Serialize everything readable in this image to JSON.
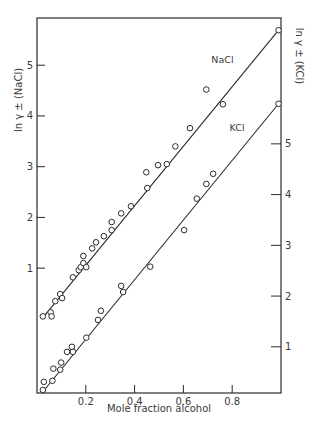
{
  "chart_data": {
    "type": "scatter",
    "title": "",
    "xlabel": "Mole fraction alcohol",
    "ylabel_left": "ln γ ± (NaCl)",
    "ylabel_right": "ln γ ± (KCl)",
    "xlim": [
      0,
      1.0
    ],
    "ylim_left": [
      -1.46,
      5.93
    ],
    "ylim_right": [
      0.09,
      7.48
    ],
    "x_ticks": [
      {
        "value": 0.2,
        "label": "0.2"
      },
      {
        "value": 0.4,
        "label": "0.4"
      },
      {
        "value": 0.6,
        "label": "0.6"
      },
      {
        "value": 0.8,
        "label": "0.8"
      }
    ],
    "y_ticks_left": [
      {
        "value": 1,
        "label": "1"
      },
      {
        "value": 2,
        "label": "2"
      },
      {
        "value": 3,
        "label": "3"
      },
      {
        "value": 4,
        "label": "4"
      },
      {
        "value": 5,
        "label": "5"
      }
    ],
    "y_ticks_right": [
      {
        "value": 1,
        "label": "1"
      },
      {
        "value": 2,
        "label": "2"
      },
      {
        "value": 3,
        "label": "3"
      },
      {
        "value": 4,
        "label": "4"
      },
      {
        "value": 5,
        "label": "5"
      }
    ],
    "grid": false,
    "legend": "none",
    "series": [
      {
        "name": "NaCl",
        "axis": "left",
        "label": "NaCl",
        "label_at": {
          "x": 0.76,
          "y": 5.04
        },
        "fit_line": [
          [
            0.02,
            0.0
          ],
          [
            0.99,
            5.69
          ]
        ],
        "points": [
          [
            0.024,
            0.05
          ],
          [
            0.056,
            0.13
          ],
          [
            0.06,
            0.05
          ],
          [
            0.075,
            0.35
          ],
          [
            0.095,
            0.49
          ],
          [
            0.103,
            0.41
          ],
          [
            0.147,
            0.82
          ],
          [
            0.171,
            0.96
          ],
          [
            0.179,
            1.02
          ],
          [
            0.19,
            1.24
          ],
          [
            0.19,
            1.1
          ],
          [
            0.202,
            1.02
          ],
          [
            0.226,
            1.39
          ],
          [
            0.242,
            1.51
          ],
          [
            0.274,
            1.63
          ],
          [
            0.306,
            1.91
          ],
          [
            0.306,
            1.75
          ],
          [
            0.345,
            2.08
          ],
          [
            0.385,
            2.22
          ],
          [
            0.448,
            2.89
          ],
          [
            0.452,
            2.58
          ],
          [
            0.496,
            3.03
          ],
          [
            0.532,
            3.05
          ],
          [
            0.567,
            3.4
          ],
          [
            0.627,
            3.76
          ],
          [
            0.694,
            4.52
          ],
          [
            0.762,
            4.23
          ],
          [
            0.99,
            5.69
          ]
        ]
      },
      {
        "name": "KCl",
        "axis": "right",
        "label": "KCl",
        "label_at": {
          "x": 0.82,
          "y": 5.26
        },
        "fit_line": [
          [
            0.02,
            0.09
          ],
          [
            0.99,
            5.79
          ]
        ],
        "points": [
          [
            0.024,
            0.15
          ],
          [
            0.028,
            0.31
          ],
          [
            0.063,
            0.33
          ],
          [
            0.067,
            0.57
          ],
          [
            0.095,
            0.55
          ],
          [
            0.099,
            0.69
          ],
          [
            0.123,
            0.9
          ],
          [
            0.143,
            1.0
          ],
          [
            0.147,
            0.9
          ],
          [
            0.202,
            1.18
          ],
          [
            0.25,
            1.53
          ],
          [
            0.262,
            1.71
          ],
          [
            0.345,
            2.2
          ],
          [
            0.353,
            2.08
          ],
          [
            0.464,
            2.58
          ],
          [
            0.603,
            3.3
          ],
          [
            0.655,
            3.92
          ],
          [
            0.694,
            4.21
          ],
          [
            0.722,
            4.41
          ],
          [
            0.99,
            5.79
          ]
        ]
      }
    ]
  }
}
